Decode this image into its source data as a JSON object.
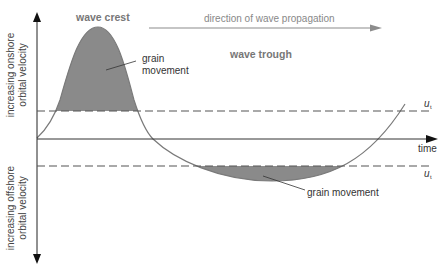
{
  "labels": {
    "wave_crest": "wave crest",
    "wave_trough": "wave trough",
    "direction": "direction of wave propagation",
    "grain_movement_crest_1": "grain",
    "grain_movement_crest_2": "movement",
    "grain_movement_trough": "grain movement",
    "time": "time",
    "threshold_upper": "u",
    "threshold_lower": "u",
    "threshold_subscript": "t",
    "y_upper_1": "increasing onshore",
    "y_upper_2": "orbital velocity",
    "y_lower_1": "increasing offshore",
    "y_lower_2": "orbital velocity"
  },
  "colors": {
    "fill": "#8a8a8a",
    "curve": "#7a7a7a",
    "axis": "#222222",
    "dashed": "#555555",
    "arrow": "#8c8c8c",
    "bold_label": "#777777",
    "text": "#333333"
  }
}
